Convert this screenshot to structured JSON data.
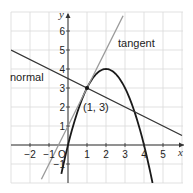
{
  "chart_data": {
    "type": "line",
    "title": "",
    "xlabel": "x",
    "ylabel": "y",
    "xlim": [
      -3,
      6
    ],
    "ylim": [
      -2,
      7
    ],
    "grid": true,
    "x_ticks": [
      "−2",
      "−1",
      "O",
      "1",
      "2",
      "3",
      "4",
      "5"
    ],
    "y_ticks": [
      "−1",
      "1",
      "2",
      "3",
      "4",
      "5",
      "6"
    ],
    "series": [
      {
        "name": "curve",
        "equation": "y = 4x − x²",
        "color": "#1a1a1a",
        "x": [
          -0.3,
          0,
          0.5,
          1,
          1.5,
          2,
          2.5,
          3,
          3.5,
          4,
          4.4
        ],
        "y": [
          -1.29,
          0,
          1.75,
          3,
          3.75,
          4,
          3.75,
          3,
          1.75,
          0,
          -1.76
        ]
      },
      {
        "name": "tangent",
        "equation": "y = 2x + 1",
        "color": "#9a9a9a",
        "x": [
          -1.4,
          2.9
        ],
        "y": [
          -1.8,
          6.8
        ]
      },
      {
        "name": "normal",
        "equation": "y = −x/2 + 3.5",
        "color": "#333333",
        "x": [
          -3,
          6
        ],
        "y": [
          5,
          0.5
        ]
      }
    ],
    "annotations": [
      {
        "text": "tangent",
        "x": 3.4,
        "y": 5.3
      },
      {
        "text": "normal",
        "x": -3,
        "y": 3.5
      },
      {
        "text": "(1, 3)",
        "x": 1.1,
        "y": 2
      }
    ],
    "point": {
      "x": 1,
      "y": 3
    }
  },
  "labels": {
    "tangent": "tangent",
    "normal": "normal",
    "point": "(1, 3)",
    "x_axis": "x",
    "y_axis": "y",
    "origin": "O"
  }
}
